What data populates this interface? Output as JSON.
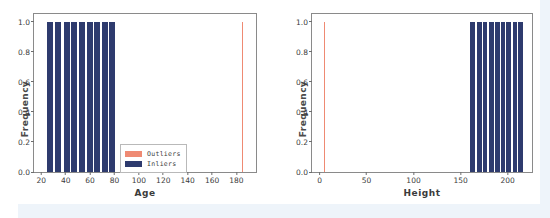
{
  "figure": {
    "panel_count": 2,
    "legend_labels": {
      "outliers": "Outliers",
      "inliers": "Inliers"
    },
    "colors": {
      "inlier": "#2e3b6e",
      "outlier": "#ef8a73",
      "axis": "#8a8a8a",
      "text": "#3b3b3b"
    }
  },
  "chart_data": [
    {
      "type": "bar",
      "title": "",
      "xlabel": "Age",
      "ylabel": "Frequency",
      "xlim": [
        14,
        196
      ],
      "ylim": [
        0.0,
        1.05
      ],
      "xticks": [
        20,
        40,
        60,
        80,
        100,
        120,
        140,
        160,
        180
      ],
      "yticks": [
        0.0,
        0.2,
        0.4,
        0.6,
        0.8,
        1.0
      ],
      "grid": false,
      "legend_position": "lower center",
      "series": [
        {
          "name": "Inliers",
          "color": "#2e3b6e",
          "x": [
            27,
            34,
            41,
            47,
            53,
            60,
            66,
            72,
            78
          ],
          "values": [
            1.0,
            1.0,
            1.0,
            1.0,
            1.0,
            1.0,
            1.0,
            1.0,
            1.0
          ],
          "bar_width": 5.0
        },
        {
          "name": "Outliers",
          "color": "#ef8a73",
          "x": [
            185
          ],
          "values": [
            1.0
          ],
          "bar_width": 0.8
        }
      ]
    },
    {
      "type": "bar",
      "title": "",
      "xlabel": "Height",
      "ylabel": "Frequency",
      "xlim": [
        -8,
        226
      ],
      "ylim": [
        0.0,
        1.05
      ],
      "xticks": [
        0,
        50,
        100,
        150,
        200
      ],
      "yticks": [
        0.0,
        0.2,
        0.4,
        0.6,
        0.8,
        1.0
      ],
      "grid": false,
      "legend_position": "lower center",
      "series": [
        {
          "name": "Outliers",
          "color": "#ef8a73",
          "x": [
            5
          ],
          "values": [
            1.0
          ],
          "bar_width": 0.9
        },
        {
          "name": "Inliers",
          "color": "#2e3b6e",
          "x": [
            163,
            170,
            176,
            183,
            189,
            195,
            201,
            208,
            214
          ],
          "values": [
            1.0,
            1.0,
            1.0,
            1.0,
            1.0,
            1.0,
            1.0,
            1.0,
            1.0
          ],
          "bar_width": 5.0
        }
      ]
    }
  ],
  "tick_text": {
    "y": [
      "0.0",
      "0.2",
      "0.4",
      "0.6",
      "0.8",
      "1.0"
    ],
    "x_left": [
      "20",
      "40",
      "60",
      "80",
      "100",
      "120",
      "140",
      "160",
      "180"
    ],
    "x_right": [
      "0",
      "50",
      "100",
      "150",
      "200"
    ]
  }
}
